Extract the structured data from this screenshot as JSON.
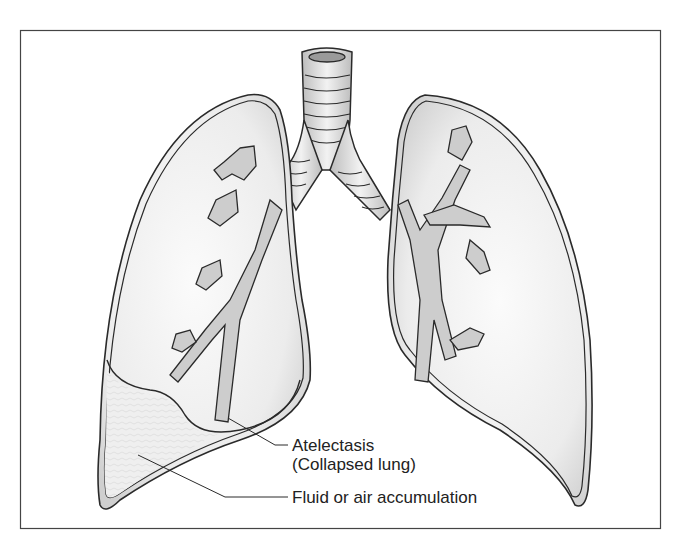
{
  "diagram": {
    "colors": {
      "outline": "#2a2a2a",
      "lung_fill": "#e6e6e6",
      "lung_highlight": "#fafafa",
      "fluid_fill": "#ececec",
      "bronchi_fill": "#c8c8c8",
      "frame": "#444444"
    },
    "structures": [
      "trachea",
      "left-bronchus",
      "right-bronchus",
      "right-lung (viewer left)",
      "left-lung (viewer right)",
      "bronchial-tree",
      "fluid-region"
    ],
    "labels": [
      {
        "id": "atelectasis",
        "line1": "Atelectasis",
        "line2": "(Collapsed lung)"
      },
      {
        "id": "fluid",
        "line1": "Fluid or air accumulation"
      }
    ]
  }
}
